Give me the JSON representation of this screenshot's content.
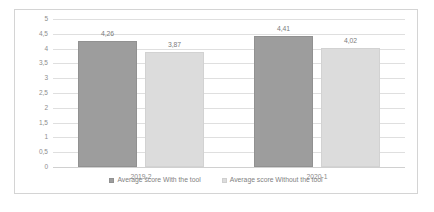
{
  "chart_data": {
    "type": "bar",
    "title": "",
    "xlabel": "",
    "ylabel": "",
    "categories": [
      "2019-2",
      "2020-1"
    ],
    "series": [
      {
        "name": "Average score With the tool",
        "color": "#9d9d9d",
        "values": [
          4.26,
          4.41
        ],
        "labels": [
          "4,26",
          "4,41"
        ]
      },
      {
        "name": "Average score Without the tool",
        "color": "#dcdcdc",
        "values": [
          3.87,
          4.02
        ],
        "labels": [
          "3,87",
          "4,02"
        ]
      }
    ],
    "ylim": [
      0,
      5
    ],
    "ytick_values": [
      0,
      0.5,
      1,
      1.5,
      2,
      2.5,
      3,
      3.5,
      4,
      4.5,
      5
    ],
    "ytick_labels": [
      "0",
      "0,5",
      "1",
      "1,5",
      "2",
      "2,5",
      "3",
      "3,5",
      "4",
      "4,5",
      "5"
    ],
    "grid": true,
    "legend_position": "bottom",
    "decimal_separator": ","
  }
}
